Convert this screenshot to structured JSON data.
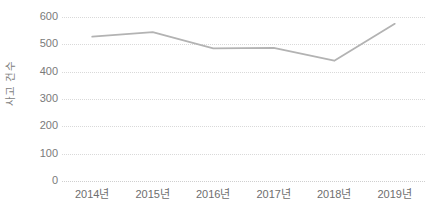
{
  "chart_data": {
    "type": "line",
    "title": "",
    "subtitle": "",
    "xlabel": "",
    "ylabel": "사고 건수",
    "categories": [
      "2014년",
      "2015년",
      "2016년",
      "2017년",
      "2018년",
      "2019년"
    ],
    "values": [
      528,
      545,
      485,
      487,
      440,
      575
    ],
    "series": [
      {
        "name": "사고 건수",
        "values": [
          528,
          545,
          485,
          487,
          440,
          575
        ],
        "color": "#b3b3b3"
      }
    ],
    "ylim": [
      0,
      600
    ],
    "yticks": [
      0,
      100,
      200,
      300,
      400,
      500,
      600
    ],
    "ytick_labels": [
      "0",
      "100",
      "200",
      "300",
      "400",
      "500",
      "600"
    ],
    "grid": true,
    "grid_style": "dotted",
    "grid_color": "#d9d9d9",
    "legend": false,
    "legend_position": "none",
    "markers": false,
    "line_color": "#b3b3b3",
    "background": "#ffffff",
    "annotations": []
  },
  "axes": {
    "y_title": "사고 건수",
    "y_tick_color": "#7a7a7a",
    "x_tick_color": "#6e6e6e"
  }
}
